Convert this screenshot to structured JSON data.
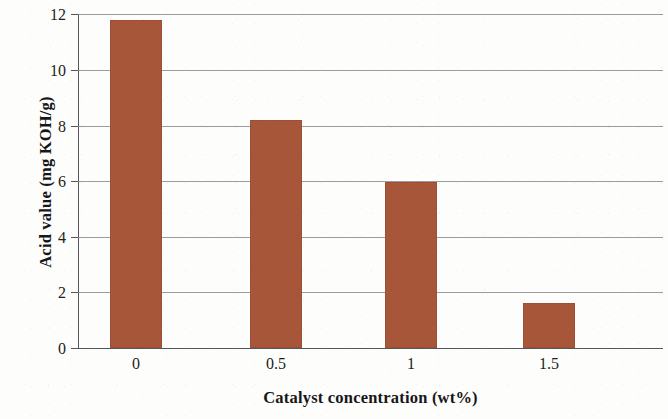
{
  "chart_data": {
    "type": "bar",
    "title": "",
    "categories": [
      "0",
      "0.5",
      "1",
      "1.5"
    ],
    "values": [
      11.8,
      8.2,
      5.95,
      1.6
    ],
    "series": [
      {
        "name": "Acid value",
        "values": [
          11.8,
          8.2,
          5.95,
          1.6
        ]
      }
    ],
    "xlabel": "Catalyst concentration (wt%)",
    "ylabel": "Acid value (mg KOH/g)",
    "ylim": [
      0,
      12
    ],
    "yticks": [
      "12",
      "10",
      "8",
      "6",
      "4",
      "2",
      "0"
    ],
    "ytick_values": [
      12,
      10,
      8,
      6,
      4,
      2,
      0
    ],
    "grid": "horizontal",
    "legend": "none",
    "bar_color": "#a8563a",
    "grid_color": "#8a8a8f",
    "axis_color": "#55555a",
    "text_color": "#1d1d20"
  }
}
